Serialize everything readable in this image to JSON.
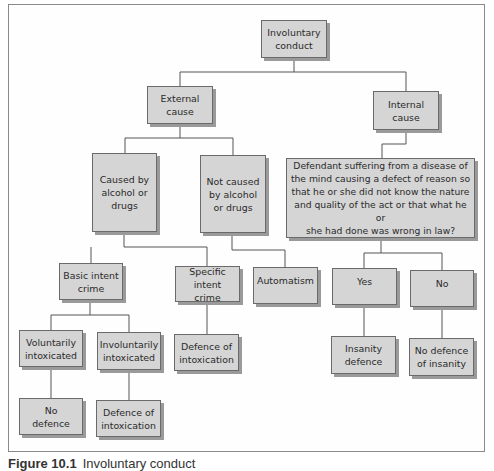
{
  "diagram": {
    "type": "decision-tree",
    "nodes": {
      "root": "Involuntary\nconduct",
      "external": "External\ncause",
      "internal": "Internal\ncause",
      "caused_by": "Caused by\nalcohol or\ndrugs",
      "not_caused_by": "Not caused\nby alcohol\nor drugs",
      "disease_question": "Defendant suffering from a disease of\nthe mind causing a defect of reason so\nthat he or she did not know the nature\nand quality of the act or that what he or\nshe had done was wrong in law?",
      "basic_intent": "Basic intent\ncrime",
      "specific_intent": "Specific\nintent crime",
      "automatism": "Automatism",
      "yes": "Yes",
      "no": "No",
      "voluntarily": "Voluntarily\nintoxicated",
      "involuntarily": "Involuntarily\nintoxicated",
      "defence_intox_specific": "Defence of\nintoxication",
      "insanity_defence": "Insanity\ndefence",
      "no_defence_insanity": "No defence\nof insanity",
      "no_defence": "No\ndefence",
      "defence_intox_involuntary": "Defence of\nintoxication"
    },
    "edges": [
      [
        "root",
        "external"
      ],
      [
        "root",
        "internal"
      ],
      [
        "external",
        "caused_by"
      ],
      [
        "external",
        "not_caused_by"
      ],
      [
        "internal",
        "disease_question"
      ],
      [
        "caused_by",
        "basic_intent"
      ],
      [
        "caused_by",
        "specific_intent"
      ],
      [
        "not_caused_by",
        "automatism"
      ],
      [
        "disease_question",
        "yes"
      ],
      [
        "disease_question",
        "no"
      ],
      [
        "basic_intent",
        "voluntarily"
      ],
      [
        "basic_intent",
        "involuntarily"
      ],
      [
        "specific_intent",
        "defence_intox_specific"
      ],
      [
        "yes",
        "insanity_defence"
      ],
      [
        "no",
        "no_defence_insanity"
      ],
      [
        "voluntarily",
        "no_defence"
      ],
      [
        "involuntarily",
        "defence_intox_involuntary"
      ]
    ]
  },
  "caption": {
    "label": "Figure 10.1",
    "text": "Involuntary conduct"
  }
}
